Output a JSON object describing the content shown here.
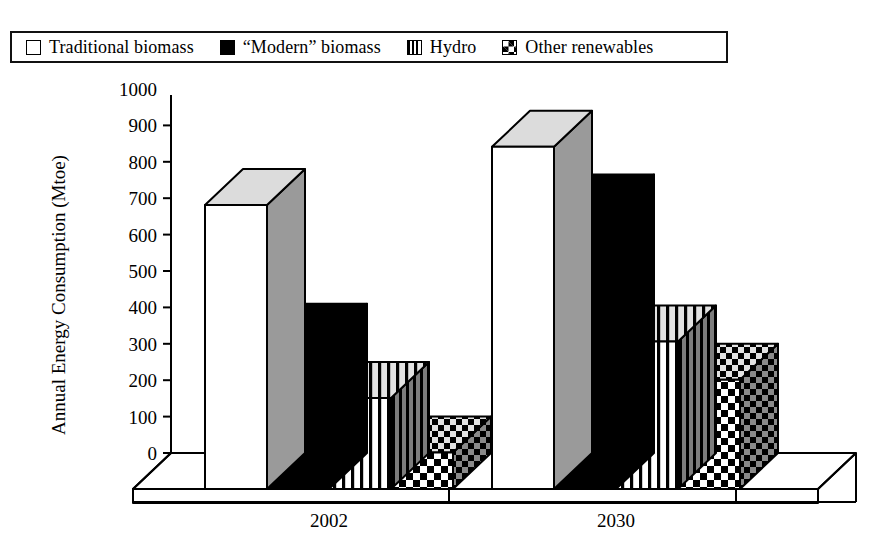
{
  "legend": {
    "items": [
      {
        "label": "Traditional biomass",
        "swatch": "open-square-icon",
        "pattern": "open"
      },
      {
        "label": "“Modern” biomass",
        "swatch": "filled-square-icon",
        "pattern": "solid-black"
      },
      {
        "label": "Hydro",
        "swatch": "vertical-stripe-square-icon",
        "pattern": "vstripe"
      },
      {
        "label": "Other renewables",
        "swatch": "checkerboard-square-icon",
        "pattern": "checker"
      }
    ]
  },
  "chart_data": {
    "type": "bar",
    "title": "",
    "xlabel": "",
    "ylabel": "Annual Energy Consumption (Mtoe)",
    "categories": [
      "2002",
      "2030"
    ],
    "series": [
      {
        "name": "Traditional biomass",
        "values": [
          780,
          940
        ],
        "pattern": "open",
        "fill": "#ffffff"
      },
      {
        "name": "“Modern” biomass",
        "values": [
          410,
          765
        ],
        "pattern": "solid-black",
        "fill": "#000000"
      },
      {
        "name": "Hydro",
        "values": [
          250,
          405
        ],
        "pattern": "vstripe",
        "fill": "#ffffff"
      },
      {
        "name": "Other renewables",
        "values": [
          100,
          300
        ],
        "pattern": "checker",
        "fill": "#ffffff"
      }
    ],
    "ylim": [
      0,
      1000
    ],
    "ytick_step": 100,
    "yticks": [
      0,
      100,
      200,
      300,
      400,
      500,
      600,
      700,
      800,
      900,
      1000
    ],
    "ytick_labels": [
      "0",
      "100",
      "200",
      "300",
      "400",
      "500",
      "600",
      "700",
      "800",
      "900",
      "1000"
    ],
    "grid": false,
    "legend_position": "top",
    "three_d": true,
    "colors": {
      "axis": "#000000",
      "outline": "#000000",
      "side_shade": "#8c8c8c",
      "top_shade": "#d8d8d8",
      "floor": "#ffffff",
      "background": "#ffffff"
    }
  }
}
